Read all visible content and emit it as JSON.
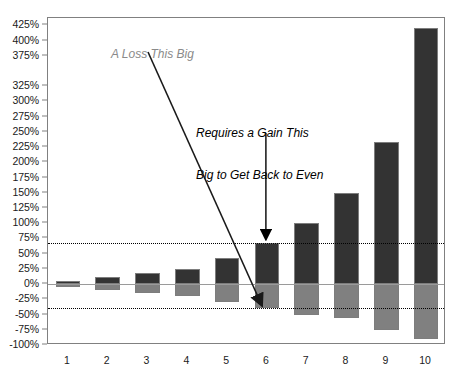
{
  "chart_data": {
    "type": "bar",
    "title": "",
    "subtitle": "",
    "xlabel": "",
    "ylabel": "",
    "categories": [
      "1",
      "2",
      "3",
      "4",
      "5",
      "6",
      "7",
      "8",
      "9",
      "10"
    ],
    "ylim": [
      -100,
      437
    ],
    "grid": false,
    "legend_position": "none",
    "y_tick_labels": [
      "425%",
      "400%",
      "375%",
      "325%",
      "300%",
      "275%",
      "250%",
      "225%",
      "200%",
      "175%",
      "150%",
      "125%",
      "100%",
      "75%",
      "50%",
      "25%",
      "0%",
      "-25%",
      "-50%",
      "-75%",
      "-100%"
    ],
    "y_tick_values": [
      425,
      400,
      375,
      325,
      300,
      275,
      250,
      225,
      200,
      175,
      150,
      125,
      100,
      75,
      50,
      25,
      0,
      -25,
      -50,
      -75,
      -100
    ],
    "series": [
      {
        "name": "Required Gain to Break Even",
        "color": "#333333",
        "values": [
          5,
          11,
          18,
          25,
          43,
          67,
          100,
          150,
          233,
          420
        ]
      },
      {
        "name": "Loss",
        "color": "#808080",
        "values": [
          -5,
          -10,
          -15,
          -20,
          -30,
          -40,
          -50,
          -55,
          -75,
          -90
        ]
      }
    ],
    "reference_lines": [
      {
        "name": "gain-reference",
        "value": 67,
        "style": "dotted",
        "color": "#000000"
      },
      {
        "name": "loss-reference",
        "value": -40,
        "style": "dotted",
        "color": "#000000"
      },
      {
        "name": "zero-line",
        "value": 0,
        "style": "solid",
        "color": "#9a9a9a"
      }
    ],
    "annotations": [
      {
        "name": "loss-annotation",
        "text": "A Loss This Big",
        "color": "#8a8a8a",
        "style": "italic",
        "points_to_category": "6",
        "points_to_value": -40
      },
      {
        "name": "gain-annotation",
        "text": "Requires a Gain This\nBig to Get Back to Even",
        "line1": "Requires a Gain This",
        "line2": "Big to Get Back to Even",
        "color": "#000000",
        "style": "italic",
        "points_to_category": "6",
        "points_to_value": 67
      }
    ],
    "colors": {
      "gain_bar": "#333333",
      "loss_bar": "#808080",
      "frame": "#808080",
      "zero_line": "#9a9a9a",
      "background": "#ffffff",
      "loss_annotation_text": "#8a8a8a",
      "gain_annotation_text": "#000000"
    }
  }
}
